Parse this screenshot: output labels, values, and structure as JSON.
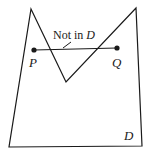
{
  "diagram": {
    "region_label": "D",
    "points": [
      {
        "label": "P",
        "x": 34,
        "y": 50
      },
      {
        "label": "Q",
        "x": 117,
        "y": 48
      }
    ],
    "annotation": {
      "prefix": "Not in ",
      "italic": "D"
    },
    "polygon": [
      [
        31,
        9
      ],
      [
        66,
        82
      ],
      [
        136,
        8
      ],
      [
        142,
        146
      ],
      [
        9,
        147
      ]
    ],
    "colors": {
      "stroke": "#1a1a1a",
      "background": "#ffffff"
    }
  }
}
